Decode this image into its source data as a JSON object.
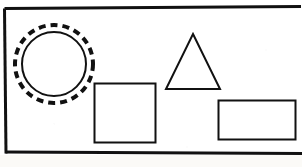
{
  "document": {
    "kind": "worksheet-figure-panel",
    "background_color": "#ffffff",
    "page_color": "#fbfaf7",
    "ink_color": "#111111",
    "width": 302,
    "height": 167
  },
  "frame": {
    "name": "panel-border",
    "description": "rectangular box border enclosing the shapes",
    "stroke_color": "#111111",
    "stroke_width": 3,
    "left": 4,
    "top": 8,
    "right": 300,
    "bottom": 152,
    "skew_note": "scan is slightly rotated; bottom edge drops ~2px left-to-right"
  },
  "shapes": [
    {
      "id": "circle-highlighted",
      "name": "circle",
      "type": "circle",
      "selected": true,
      "selection_style": "dashed-ring",
      "center_x": 54,
      "center_y": 64,
      "radius": 32,
      "stroke_color": "#111111",
      "stroke_width": 2,
      "fill": "none",
      "ring": {
        "name": "selection-ring",
        "radius": 39,
        "stroke_color": "#111111",
        "stroke_width": 4,
        "dash": "7 5"
      }
    },
    {
      "id": "square-plain",
      "name": "square",
      "type": "square",
      "selected": false,
      "x": 94,
      "y": 83,
      "width": 61,
      "height": 59,
      "stroke_color": "#111111",
      "stroke_width": 2,
      "fill": "none"
    },
    {
      "id": "triangle-plain",
      "name": "triangle",
      "type": "triangle",
      "selected": false,
      "apex_x": 193,
      "apex_y": 34,
      "base_left_x": 166,
      "base_right_x": 220,
      "base_y": 89,
      "stroke_color": "#111111",
      "stroke_width": 2,
      "fill": "none"
    },
    {
      "id": "rectangle-plain",
      "name": "rectangle",
      "type": "rectangle",
      "selected": false,
      "x": 218,
      "y": 100,
      "width": 77,
      "height": 39,
      "stroke_color": "#111111",
      "stroke_width": 2,
      "fill": "none"
    }
  ],
  "labels": {
    "circle": "",
    "square": "",
    "triangle": "",
    "rectangle": ""
  }
}
